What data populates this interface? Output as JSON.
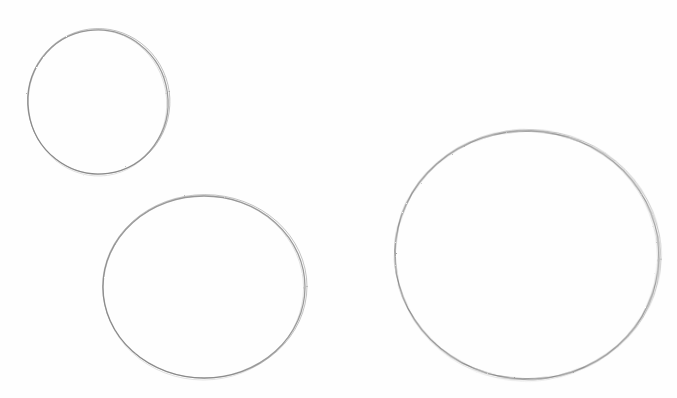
{
  "scene": {
    "description": "Pencil sketch of three hand-drawn circles on white paper",
    "background_color": "#fefefe",
    "stroke_color": "#8a8a8a",
    "stroke_dark": "#6e6e6e"
  },
  "shapes": [
    {
      "name": "small-circle",
      "cx": 98,
      "cy": 102,
      "rx": 70,
      "ry": 72,
      "rotate": -8
    },
    {
      "name": "medium-circle",
      "cx": 204,
      "cy": 287,
      "rx": 101,
      "ry": 91,
      "rotate": 0
    },
    {
      "name": "large-circle",
      "cx": 527,
      "cy": 255,
      "rx": 132,
      "ry": 124,
      "rotate": 2
    }
  ]
}
